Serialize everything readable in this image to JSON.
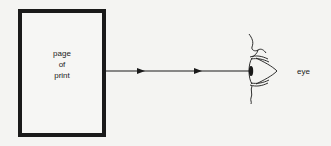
{
  "diagram": {
    "source_box": {
      "label_lines": [
        "page",
        "of",
        "print"
      ]
    },
    "ray": {
      "arrow_count": 2,
      "direction": "left-to-right"
    },
    "target": {
      "label": "eye"
    },
    "colors": {
      "ink": "#1a1a1a",
      "paper": "#f4f4f2"
    }
  }
}
